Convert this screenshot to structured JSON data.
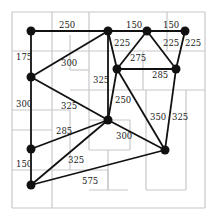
{
  "diagram": {
    "type": "weighted-graph-on-floorplan",
    "colors": {
      "edge": "#111111",
      "node": "#111111",
      "grid": "#c8c8c8",
      "label": "#222222",
      "background": "#ffffff"
    },
    "grid_lines": [
      [
        12,
        12,
        205,
        12
      ],
      [
        205,
        12,
        205,
        208
      ],
      [
        12,
        208,
        205,
        208
      ],
      [
        12,
        12,
        12,
        208
      ],
      [
        52,
        12,
        52,
        208
      ],
      [
        89,
        12,
        89,
        90
      ],
      [
        12,
        51,
        205,
        51
      ],
      [
        70,
        35,
        70,
        70
      ],
      [
        70,
        70,
        89,
        70
      ],
      [
        70,
        90,
        205,
        90
      ],
      [
        143,
        51,
        143,
        90
      ],
      [
        167,
        12,
        167,
        51
      ],
      [
        186,
        90,
        186,
        190
      ],
      [
        146,
        90,
        146,
        190
      ],
      [
        146,
        190,
        186,
        190
      ],
      [
        89,
        90,
        89,
        150
      ],
      [
        89,
        150,
        130,
        150
      ],
      [
        130,
        150,
        130,
        120
      ],
      [
        89,
        120,
        130,
        120
      ],
      [
        12,
        110,
        70,
        110
      ],
      [
        70,
        110,
        70,
        170
      ],
      [
        12,
        130,
        52,
        130
      ],
      [
        12,
        170,
        70,
        170
      ],
      [
        70,
        170,
        108,
        170
      ],
      [
        108,
        150,
        108,
        190
      ],
      [
        89,
        190,
        128,
        190
      ],
      [
        108,
        190,
        108,
        170
      ]
    ],
    "nodes": [
      {
        "id": "A",
        "x": 31,
        "y": 31
      },
      {
        "id": "B",
        "x": 108,
        "y": 31
      },
      {
        "id": "C",
        "x": 147,
        "y": 31
      },
      {
        "id": "D",
        "x": 185,
        "y": 31
      },
      {
        "id": "E",
        "x": 31,
        "y": 77
      },
      {
        "id": "F",
        "x": 117,
        "y": 69
      },
      {
        "id": "G",
        "x": 176,
        "y": 69
      },
      {
        "id": "H",
        "x": 108,
        "y": 120
      },
      {
        "id": "I",
        "x": 165,
        "y": 150
      },
      {
        "id": "J",
        "x": 31,
        "y": 149
      },
      {
        "id": "K",
        "x": 31,
        "y": 185
      }
    ],
    "edges": [
      {
        "from": "A",
        "to": "B",
        "weight": "250",
        "lx": 59,
        "ly": 28
      },
      {
        "from": "B",
        "to": "C",
        "weight": "150",
        "lx": 126,
        "ly": 28
      },
      {
        "from": "C",
        "to": "D",
        "weight": "150",
        "lx": 163,
        "ly": 28
      },
      {
        "from": "A",
        "to": "E",
        "weight": "175",
        "lx": 16,
        "ly": 60
      },
      {
        "from": "E",
        "to": "B",
        "weight": "300",
        "lx": 61,
        "ly": 66
      },
      {
        "from": "B",
        "to": "F",
        "weight": "225",
        "lx": 114,
        "ly": 46
      },
      {
        "from": "B",
        "to": "H",
        "weight": "325",
        "lx": 93,
        "ly": 83
      },
      {
        "from": "C",
        "to": "F",
        "weight": "275",
        "lx": 130,
        "ly": 61
      },
      {
        "from": "C",
        "to": "G",
        "weight": "225",
        "lx": 163,
        "ly": 46
      },
      {
        "from": "D",
        "to": "G",
        "weight": "225",
        "lx": 185,
        "ly": 46
      },
      {
        "from": "F",
        "to": "G",
        "weight": "285",
        "lx": 152,
        "ly": 78
      },
      {
        "from": "F",
        "to": "H",
        "weight": "250",
        "lx": 115,
        "ly": 103
      },
      {
        "from": "F",
        "to": "I",
        "weight": "350",
        "lx": 150,
        "ly": 120
      },
      {
        "from": "G",
        "to": "I",
        "weight": "325",
        "lx": 172,
        "ly": 120
      },
      {
        "from": "E",
        "to": "J",
        "weight": "300",
        "lx": 16,
        "ly": 107
      },
      {
        "from": "E",
        "to": "H",
        "weight": "325",
        "lx": 61,
        "ly": 109
      },
      {
        "from": "H",
        "to": "I",
        "weight": "300",
        "lx": 116,
        "ly": 139
      },
      {
        "from": "J",
        "to": "H",
        "weight": "285",
        "lx": 56,
        "ly": 134
      },
      {
        "from": "J",
        "to": "K",
        "weight": "150",
        "lx": 16,
        "ly": 167
      },
      {
        "from": "K",
        "to": "H",
        "weight": "325",
        "lx": 68,
        "ly": 163
      },
      {
        "from": "K",
        "to": "I",
        "weight": "575",
        "lx": 82,
        "ly": 184
      }
    ]
  }
}
